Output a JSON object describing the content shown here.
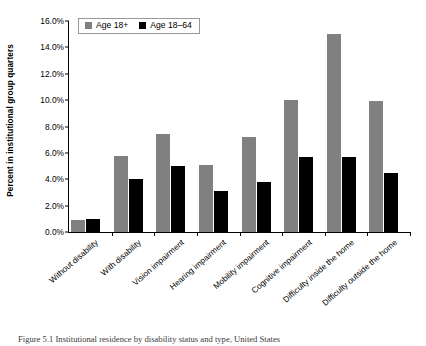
{
  "chart_data": {
    "type": "bar",
    "title": "",
    "xlabel": "",
    "ylabel": "Percent in institutional group quarters",
    "ylim": [
      0,
      16
    ],
    "ytick_labels": [
      "0.0%",
      "2.0%",
      "4.0%",
      "6.0%",
      "8.0%",
      "10.0%",
      "12.0%",
      "14.0%",
      "16.0%"
    ],
    "ytick_values": [
      0,
      2,
      4,
      6,
      8,
      10,
      12,
      14,
      16
    ],
    "grid": false,
    "legend_position": "top-left",
    "categories": [
      "Without disability",
      "With disability",
      "Vision impairment",
      "Hearing impairment",
      "Mobility impairment",
      "Cognitive impairment",
      "Difficulty inside the home",
      "Difficulty outside the home"
    ],
    "series": [
      {
        "name": "Age 18+",
        "color": "#808080",
        "values": [
          0.9,
          5.8,
          7.4,
          5.1,
          7.2,
          10.0,
          15.0,
          9.9
        ]
      },
      {
        "name": "Age 18–64",
        "color": "#000000",
        "values": [
          1.0,
          4.0,
          5.0,
          3.1,
          3.8,
          5.7,
          5.7,
          4.5
        ]
      }
    ]
  },
  "caption": {
    "text": "Figure 5.1  Institutional residence by disability status and type, United States"
  }
}
